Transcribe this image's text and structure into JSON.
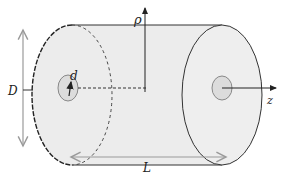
{
  "diagram": {
    "labels": {
      "diameter_outer": "D",
      "diameter_inner": "d",
      "length": "L",
      "radial": "ρ",
      "axial": "z"
    },
    "colors": {
      "fill": "#ececec",
      "inner_fill": "#dcdcdc",
      "stroke": "#333333",
      "dim_arrow": "#9a9a9a"
    }
  }
}
